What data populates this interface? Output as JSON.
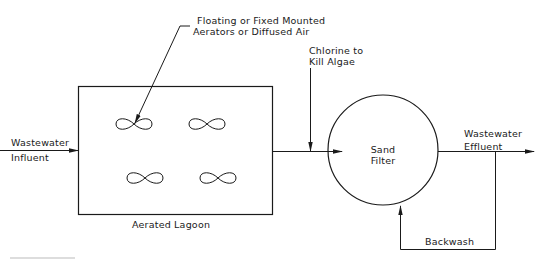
{
  "diagram": {
    "type": "process-flow",
    "colors": {
      "line": "#1a1a1a",
      "background": "#ffffff"
    },
    "nodes": {
      "lagoon": {
        "label": "Aerated Lagoon",
        "shape": "rectangle",
        "aerator_count": 4,
        "aerator_icon": "infinity-loop-icon"
      },
      "sand_filter": {
        "label_line1": "Sand",
        "label_line2": "Filter",
        "shape": "circle"
      }
    },
    "labels": {
      "aerators_line1": "Floating or Fixed Mounted",
      "aerators_line2": "Aerators or Diffused Air",
      "chlorine_line1": "Chlorine to",
      "chlorine_line2": "Kill Algae",
      "influent_line1": "Wastewater",
      "influent_line2": "Influent",
      "effluent_line1": "Wastewater",
      "effluent_line2": "Effluent",
      "backwash": "Backwash"
    },
    "flows": [
      {
        "from": "Wastewater Influent",
        "to": "Aerated Lagoon"
      },
      {
        "from": "Aerated Lagoon",
        "to": "Sand Filter"
      },
      {
        "from": "Chlorine to Kill Algae",
        "to": "Aerated Lagoon outlet line"
      },
      {
        "from": "Sand Filter",
        "to": "Wastewater Effluent"
      },
      {
        "from": "Wastewater Effluent line",
        "to": "Sand Filter",
        "label": "Backwash"
      }
    ]
  }
}
